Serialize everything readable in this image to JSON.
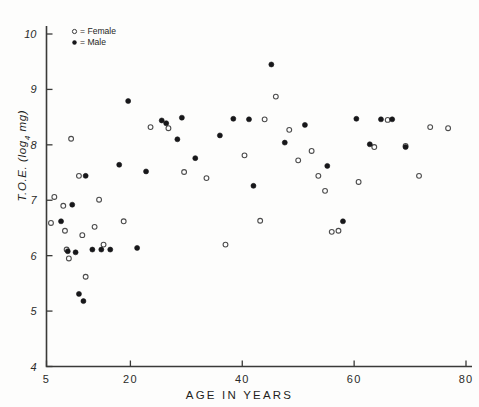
{
  "chart_data": {
    "type": "scatter",
    "title": "",
    "xlabel": "AGE IN YEARS",
    "ylabel": "T.O.E. (log4 mg)",
    "ylabel_base": "T.O.E. (log",
    "ylabel_sub": "4",
    "ylabel_tail": " mg)",
    "xlim": [
      5,
      80
    ],
    "ylim": [
      4,
      10
    ],
    "xticks": [
      5,
      20,
      40,
      60,
      80
    ],
    "xtick_labels": [
      "5",
      "20",
      "40",
      "60",
      "80"
    ],
    "yticks": [
      4,
      5,
      6,
      7,
      8,
      9,
      10
    ],
    "ytick_labels": [
      "4",
      "5",
      "6",
      "7",
      "8",
      "9",
      "10"
    ],
    "grid": false,
    "legend_position": "top-left-inside",
    "legend": [
      {
        "symbol": "open-circle",
        "label": "= Female"
      },
      {
        "symbol": "filled-circle",
        "label": "= Male"
      }
    ],
    "series": [
      {
        "name": "Female",
        "marker": "open-circle",
        "color": "#ffffff",
        "edge_color": "#4b4b4b",
        "points": [
          {
            "x": 5.8,
            "y": 6.59
          },
          {
            "x": 6.4,
            "y": 7.06
          },
          {
            "x": 8.0,
            "y": 6.9
          },
          {
            "x": 8.3,
            "y": 6.45
          },
          {
            "x": 8.6,
            "y": 6.11
          },
          {
            "x": 9.0,
            "y": 5.95
          },
          {
            "x": 9.4,
            "y": 8.11
          },
          {
            "x": 10.8,
            "y": 7.44
          },
          {
            "x": 11.4,
            "y": 6.37
          },
          {
            "x": 12.0,
            "y": 5.62
          },
          {
            "x": 13.6,
            "y": 6.52
          },
          {
            "x": 14.4,
            "y": 7.01
          },
          {
            "x": 15.2,
            "y": 6.2
          },
          {
            "x": 18.8,
            "y": 6.62
          },
          {
            "x": 23.6,
            "y": 8.32
          },
          {
            "x": 26.8,
            "y": 8.3
          },
          {
            "x": 29.6,
            "y": 7.51
          },
          {
            "x": 33.6,
            "y": 7.4
          },
          {
            "x": 37.0,
            "y": 6.2
          },
          {
            "x": 40.4,
            "y": 7.81
          },
          {
            "x": 43.2,
            "y": 6.63
          },
          {
            "x": 44.0,
            "y": 8.46
          },
          {
            "x": 46.0,
            "y": 8.87
          },
          {
            "x": 48.4,
            "y": 8.27
          },
          {
            "x": 50.0,
            "y": 7.72
          },
          {
            "x": 52.4,
            "y": 7.89
          },
          {
            "x": 53.6,
            "y": 7.44
          },
          {
            "x": 54.8,
            "y": 7.17
          },
          {
            "x": 56.0,
            "y": 6.43
          },
          {
            "x": 57.2,
            "y": 6.45
          },
          {
            "x": 60.8,
            "y": 7.33
          },
          {
            "x": 63.6,
            "y": 7.96
          },
          {
            "x": 66.0,
            "y": 8.45
          },
          {
            "x": 69.2,
            "y": 7.98
          },
          {
            "x": 71.6,
            "y": 7.44
          },
          {
            "x": 73.6,
            "y": 8.32
          },
          {
            "x": 76.8,
            "y": 8.3
          }
        ]
      },
      {
        "name": "Male",
        "marker": "filled-circle",
        "color": "#17171a",
        "edge_color": "#17171a",
        "points": [
          {
            "x": 7.6,
            "y": 6.62
          },
          {
            "x": 8.8,
            "y": 6.08
          },
          {
            "x": 9.6,
            "y": 6.92
          },
          {
            "x": 10.2,
            "y": 6.06
          },
          {
            "x": 10.8,
            "y": 5.31
          },
          {
            "x": 11.6,
            "y": 5.18
          },
          {
            "x": 12.0,
            "y": 7.44
          },
          {
            "x": 13.2,
            "y": 6.11
          },
          {
            "x": 14.8,
            "y": 6.11
          },
          {
            "x": 16.4,
            "y": 6.11
          },
          {
            "x": 18.0,
            "y": 7.64
          },
          {
            "x": 19.6,
            "y": 8.79
          },
          {
            "x": 21.2,
            "y": 6.14
          },
          {
            "x": 22.8,
            "y": 7.52
          },
          {
            "x": 25.6,
            "y": 8.44
          },
          {
            "x": 26.4,
            "y": 8.39
          },
          {
            "x": 28.4,
            "y": 8.1
          },
          {
            "x": 29.2,
            "y": 8.49
          },
          {
            "x": 31.6,
            "y": 7.76
          },
          {
            "x": 36.0,
            "y": 8.17
          },
          {
            "x": 38.4,
            "y": 8.47
          },
          {
            "x": 41.2,
            "y": 8.46
          },
          {
            "x": 42.0,
            "y": 7.26
          },
          {
            "x": 45.2,
            "y": 9.45
          },
          {
            "x": 47.6,
            "y": 8.04
          },
          {
            "x": 51.2,
            "y": 8.36
          },
          {
            "x": 55.2,
            "y": 7.62
          },
          {
            "x": 58.0,
            "y": 6.62
          },
          {
            "x": 60.4,
            "y": 8.47
          },
          {
            "x": 62.8,
            "y": 8.01
          },
          {
            "x": 64.8,
            "y": 8.46
          },
          {
            "x": 66.8,
            "y": 8.46
          },
          {
            "x": 69.2,
            "y": 7.96
          }
        ]
      }
    ]
  }
}
